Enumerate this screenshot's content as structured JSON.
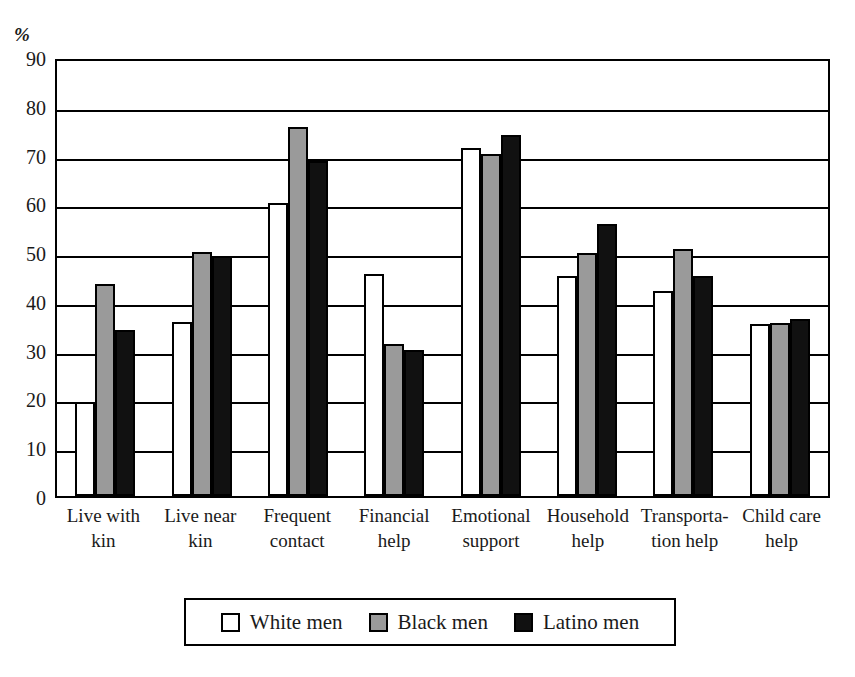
{
  "chart_data": {
    "type": "bar",
    "title": "",
    "subtitle": "",
    "xlabel": "",
    "ylabel": "%",
    "ylim": [
      0,
      90
    ],
    "ytick_step": 10,
    "yticks": [
      "90",
      "80",
      "70",
      "60",
      "50",
      "40",
      "30",
      "20",
      "10",
      "0"
    ],
    "grid": true,
    "legend_position": "bottom",
    "categories": [
      "Live with kin",
      "Live near kin",
      "Frequent contact",
      "Financial help",
      "Emotional support",
      "Household help",
      "Transportation help",
      "Child care help"
    ],
    "category_lines": [
      [
        "Live with",
        "kin"
      ],
      [
        "Live near",
        "kin"
      ],
      [
        "Frequent",
        "contact"
      ],
      [
        "Financial",
        "help"
      ],
      [
        "Emotional",
        "support"
      ],
      [
        "Household",
        "help"
      ],
      [
        "Transporta-",
        "tion help"
      ],
      [
        "Child care",
        "help"
      ]
    ],
    "series": [
      {
        "name": "White men",
        "color": "#ffffff",
        "style": "white",
        "values": [
          19.2,
          35.6,
          60.0,
          45.5,
          71.4,
          45.2,
          42.0,
          35.3
        ]
      },
      {
        "name": "Black men",
        "color": "#9a9a9a",
        "style": "gray",
        "values": [
          43.5,
          50.1,
          75.7,
          31.2,
          70.2,
          49.8,
          50.6,
          35.5
        ]
      },
      {
        "name": "Latino men",
        "color": "#111111",
        "style": "black",
        "values": [
          34.1,
          49.2,
          68.6,
          30.0,
          74.0,
          55.8,
          45.2,
          36.3
        ]
      }
    ]
  },
  "legend": {
    "items": [
      {
        "label": "White men",
        "style": "white"
      },
      {
        "label": "Black men",
        "style": "gray"
      },
      {
        "label": "Latino men",
        "style": "black"
      }
    ]
  }
}
